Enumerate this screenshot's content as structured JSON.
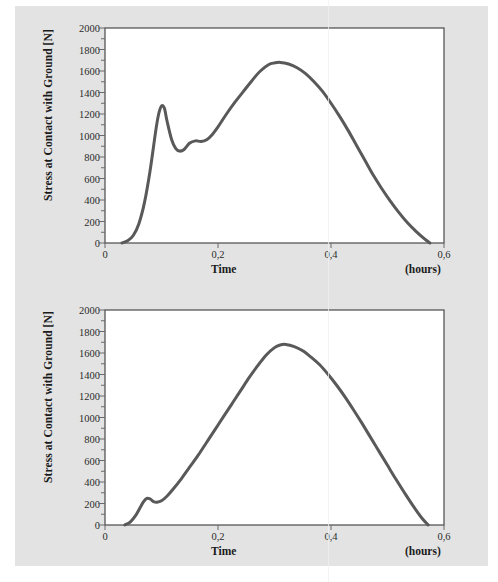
{
  "page": {
    "background_color": "#e3e3e3",
    "outer_color": "#ffffff"
  },
  "figures": [
    {
      "id": "figure-top",
      "name": "stress-at-contact-figure-1"
    },
    {
      "id": "figure-bottom",
      "name": "stress-at-contact-figure-2"
    }
  ],
  "axis": {
    "ylabel": "Stress at Contact with Ground [N]",
    "xlabel": "Time",
    "xunit": "(hours)",
    "yticks": [
      "2000",
      "1800",
      "1600",
      "1400",
      "1200",
      "1000",
      "800",
      "600",
      "400",
      "200",
      "0"
    ],
    "ytick_values": [
      2000,
      1800,
      1600,
      1400,
      1200,
      1000,
      800,
      600,
      400,
      200,
      0
    ],
    "xticks": [
      "0",
      "0,2",
      "0,4",
      "0,6"
    ],
    "xtick_values": [
      0,
      0.2,
      0.4,
      0.6
    ]
  },
  "chart_data": [
    {
      "type": "line",
      "title": "",
      "xlabel": "Time",
      "ylabel": "Stress at Contact with Ground [N]",
      "xunit": "(hours)",
      "xlim": [
        0,
        0.6
      ],
      "ylim": [
        0,
        2000
      ],
      "grid": false,
      "legend": "none",
      "line_color": "#595959",
      "line_width": 3,
      "description": "Double-peaked ground reaction force curve: sharp impact peak near t=0.10 reaching ~1280 N, dip to ~850 N, then broad propulsive peak near t=0.30 reaching ~1680 N.",
      "x": [
        0.03,
        0.04,
        0.05,
        0.06,
        0.07,
        0.08,
        0.09,
        0.095,
        0.1,
        0.105,
        0.11,
        0.118,
        0.125,
        0.132,
        0.14,
        0.15,
        0.16,
        0.17,
        0.18,
        0.19,
        0.2,
        0.215,
        0.23,
        0.245,
        0.26,
        0.275,
        0.29,
        0.3,
        0.31,
        0.325,
        0.34,
        0.355,
        0.37,
        0.385,
        0.4,
        0.415,
        0.43,
        0.445,
        0.46,
        0.475,
        0.49,
        0.505,
        0.52,
        0.535,
        0.55,
        0.565,
        0.575
      ],
      "y": [
        0,
        20,
        70,
        180,
        380,
        680,
        1050,
        1200,
        1275,
        1255,
        1130,
        960,
        880,
        855,
        870,
        930,
        950,
        945,
        960,
        1010,
        1080,
        1200,
        1310,
        1410,
        1510,
        1600,
        1660,
        1675,
        1680,
        1665,
        1630,
        1575,
        1500,
        1410,
        1300,
        1180,
        1050,
        910,
        770,
        630,
        505,
        390,
        285,
        190,
        110,
        40,
        0
      ]
    },
    {
      "type": "line",
      "title": "",
      "xlabel": "Time",
      "ylabel": "Stress at Contact with Ground [N]",
      "xunit": "(hours)",
      "xlim": [
        0,
        0.6
      ],
      "ylim": [
        0,
        2000
      ],
      "grid": false,
      "legend": "none",
      "line_color": "#595959",
      "line_width": 3,
      "description": "Single broad peak ground reaction force curve with a small early bump at ~t=0.075 reaching ~250 N, rising to a maximum of ~1680 N near t=0.31.",
      "x": [
        0.035,
        0.045,
        0.055,
        0.062,
        0.068,
        0.074,
        0.08,
        0.086,
        0.092,
        0.1,
        0.11,
        0.12,
        0.135,
        0.15,
        0.165,
        0.18,
        0.195,
        0.21,
        0.225,
        0.24,
        0.255,
        0.27,
        0.285,
        0.3,
        0.31,
        0.32,
        0.335,
        0.35,
        0.365,
        0.38,
        0.395,
        0.41,
        0.425,
        0.44,
        0.455,
        0.47,
        0.485,
        0.5,
        0.515,
        0.53,
        0.545,
        0.56,
        0.572
      ],
      "y": [
        0,
        30,
        95,
        160,
        215,
        248,
        242,
        218,
        212,
        225,
        270,
        330,
        430,
        540,
        650,
        770,
        890,
        1010,
        1130,
        1250,
        1370,
        1480,
        1580,
        1650,
        1675,
        1680,
        1660,
        1620,
        1560,
        1490,
        1400,
        1300,
        1190,
        1070,
        945,
        815,
        685,
        555,
        425,
        300,
        180,
        70,
        0
      ]
    }
  ]
}
